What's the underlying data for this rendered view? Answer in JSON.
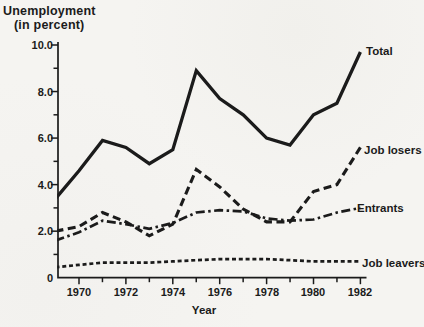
{
  "title": {
    "line1": "Unemployment",
    "line2": "(in percent)"
  },
  "chart_data": {
    "type": "line",
    "title": "Unemployment (in percent)",
    "xlabel": "Year",
    "ylabel": "Unemployment (in percent)",
    "xlim": [
      1969,
      1982.3
    ],
    "ylim": [
      0,
      10
    ],
    "grid": false,
    "legend": "inline-end-of-line-labels",
    "x": [
      1969,
      1970,
      1971,
      1972,
      1973,
      1974,
      1975,
      1976,
      1977,
      1978,
      1979,
      1980,
      1981,
      1982
    ],
    "xtick_labels": [
      "1970",
      "1972",
      "1974",
      "1976",
      "1978",
      "1980",
      "1982"
    ],
    "ytick_labels": [
      "10.0",
      "8.0",
      "6.0",
      "4.0",
      "2.0",
      "0"
    ],
    "yticks_major": [
      0,
      2,
      4,
      6,
      8,
      10
    ],
    "yticks_minor": [
      1,
      3,
      5,
      7,
      9
    ],
    "series": [
      {
        "name": "Total",
        "style": "solid",
        "values": [
          3.4,
          4.6,
          5.9,
          5.6,
          4.9,
          5.5,
          8.9,
          7.7,
          7.0,
          6.0,
          5.7,
          7.0,
          7.5,
          9.7
        ]
      },
      {
        "name": "Job losers",
        "style": "long-dash",
        "values": [
          2.0,
          2.2,
          2.8,
          2.4,
          1.8,
          2.3,
          4.65,
          3.9,
          2.95,
          2.4,
          2.4,
          3.7,
          4.0,
          5.6
        ]
      },
      {
        "name": "Entrants",
        "style": "dash-dot",
        "values": [
          1.6,
          1.95,
          2.45,
          2.3,
          2.1,
          2.35,
          2.8,
          2.9,
          2.85,
          2.55,
          2.45,
          2.5,
          2.8,
          3.0
        ]
      },
      {
        "name": "Job leavers",
        "style": "short-dash",
        "values": [
          0.45,
          0.55,
          0.65,
          0.65,
          0.65,
          0.7,
          0.75,
          0.8,
          0.8,
          0.8,
          0.75,
          0.7,
          0.7,
          0.7
        ]
      }
    ],
    "colors": {
      "ink": "#1b1b1b",
      "paper": "#f5f4f1"
    }
  }
}
